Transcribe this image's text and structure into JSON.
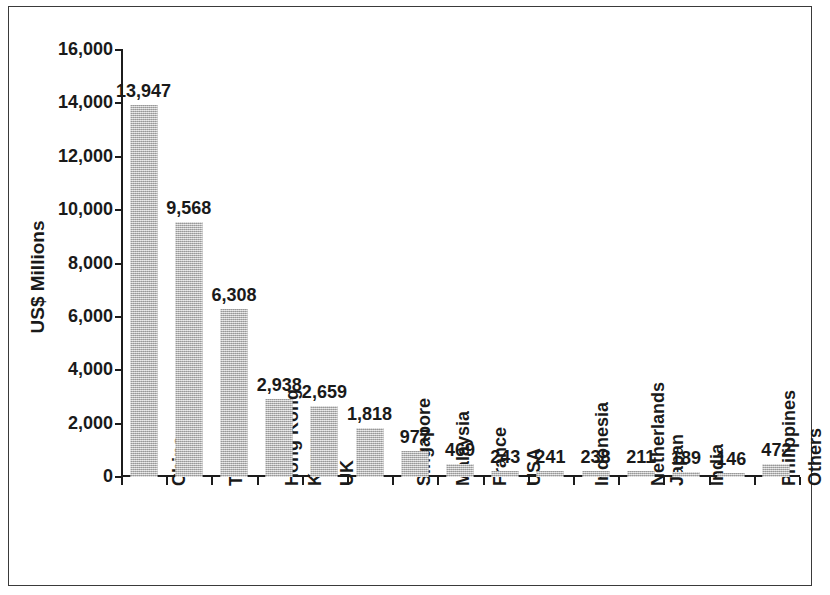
{
  "chart_data": {
    "type": "bar",
    "title": "",
    "subtitle": "",
    "xlabel": "",
    "ylabel": "US$ Millions",
    "ylim": [
      0,
      16000
    ],
    "ytick_labels": [
      "16,000",
      "14,000",
      "12,000",
      "10,000",
      "8,000",
      "6,000",
      "4,000",
      "2,000",
      "0"
    ],
    "ytick_values": [
      16000,
      14000,
      12000,
      10000,
      8000,
      6000,
      4000,
      2000,
      0
    ],
    "grid": false,
    "legend": null,
    "bar_color": "#bcbcbc",
    "axis_color": "#1c1c1c",
    "categories": [
      "China",
      "Thailand",
      "Hong Kong",
      "Korea",
      "UK",
      "Singapore",
      "Malaysia",
      "France",
      "USA",
      "Indonesia",
      "Netherlands",
      "Japan",
      "India",
      "Philippines",
      "Others"
    ],
    "values": [
      13947,
      9568,
      6308,
      2938,
      2659,
      1818,
      977,
      469,
      243,
      241,
      238,
      211,
      189,
      146,
      472
    ],
    "value_labels": [
      "13,947",
      "9,568",
      "6,308",
      "2,938",
      "2,659",
      "1,818",
      "977",
      "469",
      "243",
      "241",
      "238",
      "211",
      "189",
      "146",
      "472"
    ]
  }
}
